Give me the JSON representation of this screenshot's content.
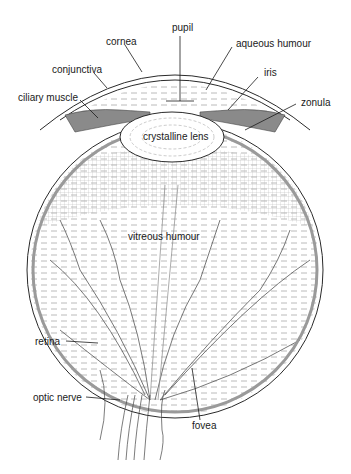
{
  "diagram": {
    "type": "anatomical cross-section",
    "labels": {
      "pupil": "pupil",
      "cornea": "cornea",
      "aqueous_humour": "aqueous humour",
      "conjunctiva": "conjunctiva",
      "iris": "iris",
      "ciliary_muscle": "ciliary muscle",
      "zonula": "zonula",
      "crystalline_lens": "crystalline lens",
      "vitreous_humour": "vitreous humour",
      "retina": "retina",
      "optic_nerve": "optic nerve",
      "fovea": "fovea"
    },
    "colors": {
      "line": "#2a2a2a",
      "muscle_fill": "#8a8a8a",
      "retina_band": "#9a9a9a",
      "hatch": "#b0b0b0",
      "background": "#ffffff"
    }
  }
}
